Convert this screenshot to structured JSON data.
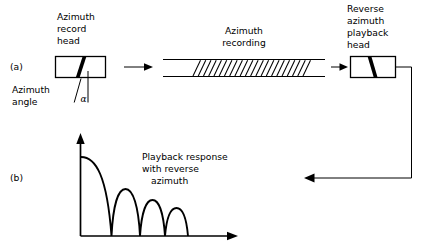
{
  "figure": {
    "panel_a_label": "(a)",
    "panel_b_label": "(b)"
  },
  "panel_a": {
    "record_head": {
      "label_line1": "Azimuth",
      "label_line2": "record",
      "label_line3": "head",
      "icon": "record-head-gap"
    },
    "azimuth_angle": {
      "label_line1": "Azimuth",
      "label_line2": "angle",
      "symbol": "α"
    },
    "tape": {
      "label_line1": "Azimuth",
      "label_line2": "recording",
      "hatch_count": 22,
      "icon": "magnetic-tape"
    },
    "playback_head": {
      "label_line1": "Reverse",
      "label_line2": "azimuth",
      "label_line3": "playback",
      "label_line4": "head",
      "icon": "playback-head-gap"
    },
    "flow_arrow_1": "arrow-right-icon",
    "flow_arrow_2": "arrow-right-icon",
    "feedback_arrow": "arrow-left-icon"
  },
  "panel_b": {
    "caption_line1": "Playback response",
    "caption_line2": "with reverse",
    "caption_line3": "azimuth",
    "y_axis_icon": "axis-arrow-up-icon",
    "x_axis_icon": "axis-arrow-right-icon"
  },
  "colors": {
    "ink": "#000000",
    "paper": "#ffffff"
  },
  "chart_data": {
    "type": "line",
    "xlabel": "",
    "ylabel": "",
    "grid": false,
    "legend": null,
    "x": [
      0.0,
      0.25,
      0.5,
      0.75,
      1.0,
      1.25,
      1.5,
      1.75,
      2.0,
      2.25,
      2.5,
      2.75,
      3.0,
      3.25,
      3.5,
      3.75,
      4.0
    ],
    "y": [
      1.0,
      0.97,
      0.83,
      0.49,
      0.0,
      0.42,
      0.55,
      0.39,
      0.0,
      0.3,
      0.36,
      0.26,
      0.0,
      0.2,
      0.24,
      0.17,
      0.0
    ],
    "lobes": [
      {
        "index": 1,
        "start": 0.0,
        "end": 1.0,
        "peak_x": 0.0,
        "peak_y": 1.0
      },
      {
        "index": 2,
        "start": 1.0,
        "end": 2.0,
        "peak_x": 1.5,
        "peak_y": 0.55
      },
      {
        "index": 3,
        "start": 2.0,
        "end": 3.0,
        "peak_x": 2.5,
        "peak_y": 0.36
      },
      {
        "index": 4,
        "start": 3.0,
        "end": 4.0,
        "peak_x": 3.5,
        "peak_y": 0.24
      }
    ],
    "xlim": [
      0,
      4.8
    ],
    "ylim": [
      0,
      1.15
    ]
  }
}
